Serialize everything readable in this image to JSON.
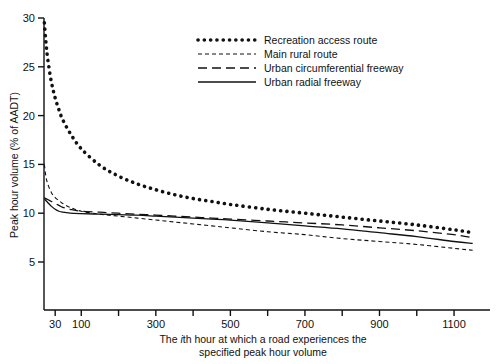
{
  "chart_data": {
    "type": "line",
    "title": "",
    "subtitle": "",
    "xlabel_line1": "The ith hour at which a road experiences the",
    "xlabel_line2": "specified peak hour volume",
    "xlabel_italic_char": "i",
    "ylabel": "Peak hour volume (% of AADT)",
    "xlim": [
      0,
      1175
    ],
    "ylim": [
      0,
      30
    ],
    "grid": false,
    "legend_position": "upper-center-right",
    "xticks": [
      30,
      100,
      200,
      300,
      400,
      500,
      600,
      700,
      800,
      900,
      1000,
      1100
    ],
    "xtick_labels": [
      "30",
      "100",
      "",
      "300",
      "",
      "500",
      "",
      "700",
      "",
      "900",
      "",
      "1100"
    ],
    "yticks": [
      5,
      10,
      15,
      20,
      25,
      30
    ],
    "ytick_labels": [
      "5",
      "10",
      "15",
      "20",
      "25",
      "30"
    ],
    "x": [
      1,
      5,
      10,
      20,
      30,
      40,
      50,
      70,
      100,
      150,
      200,
      250,
      300,
      350,
      400,
      450,
      500,
      600,
      700,
      800,
      900,
      1000,
      1100,
      1150
    ],
    "series": [
      {
        "name": "Recreation access route",
        "style": "dotted",
        "values": [
          29.5,
          27.6,
          25.8,
          23.4,
          21.8,
          20.6,
          19.6,
          18.2,
          16.6,
          14.9,
          13.8,
          13.0,
          12.4,
          11.9,
          11.5,
          11.2,
          10.9,
          10.4,
          10.0,
          9.6,
          9.2,
          8.8,
          8.3,
          8.0
        ]
      },
      {
        "name": "Main rural route",
        "style": "fine-dashed",
        "values": [
          15.0,
          13.8,
          13.0,
          12.1,
          11.6,
          11.3,
          11.0,
          10.6,
          10.2,
          9.9,
          9.7,
          9.5,
          9.3,
          9.1,
          8.9,
          8.7,
          8.5,
          8.1,
          7.8,
          7.4,
          7.1,
          6.8,
          6.4,
          6.2
        ]
      },
      {
        "name": "Urban circumferential freeway",
        "style": "dashed",
        "values": [
          11.6,
          11.5,
          11.4,
          11.2,
          11.0,
          10.8,
          10.6,
          10.4,
          10.2,
          10.1,
          10.0,
          9.9,
          9.8,
          9.7,
          9.6,
          9.5,
          9.4,
          9.2,
          9.0,
          8.8,
          8.5,
          8.2,
          7.8,
          7.5
        ]
      },
      {
        "name": "Urban radial freeway",
        "style": "solid",
        "values": [
          11.5,
          11.3,
          11.1,
          10.7,
          10.4,
          10.2,
          10.1,
          10.0,
          9.95,
          9.9,
          9.85,
          9.8,
          9.7,
          9.6,
          9.5,
          9.4,
          9.3,
          9.0,
          8.7,
          8.4,
          8.0,
          7.6,
          7.1,
          6.9
        ]
      }
    ]
  },
  "legend": {
    "items": [
      {
        "label": "Recreation access route",
        "style": "dotted"
      },
      {
        "label": "Main rural route",
        "style": "fine-dashed"
      },
      {
        "label": "Urban circumferential freeway",
        "style": "dashed"
      },
      {
        "label": "Urban radial freeway",
        "style": "solid"
      }
    ]
  },
  "colors": {
    "ink": "#111111",
    "background": "#ffffff"
  }
}
